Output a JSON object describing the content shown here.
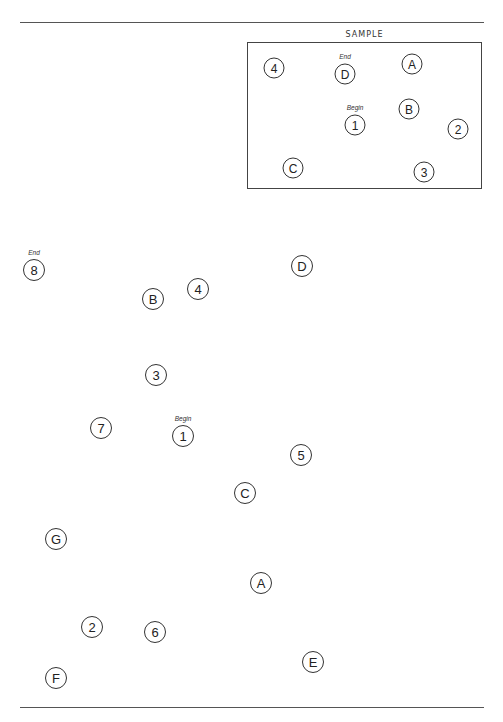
{
  "document": {
    "title": "Trail Making Test Part B",
    "sample": {
      "label": "SAMPLE",
      "box": {
        "left": 247,
        "top": 42,
        "right": 482,
        "bottom": 189
      },
      "nodes": [
        {
          "label": "4",
          "x": 274,
          "y": 68
        },
        {
          "label": "D",
          "x": 345,
          "y": 74,
          "tag": "End"
        },
        {
          "label": "A",
          "x": 412,
          "y": 64
        },
        {
          "label": "1",
          "x": 355,
          "y": 125,
          "tag": "Begin"
        },
        {
          "label": "B",
          "x": 409,
          "y": 109
        },
        {
          "label": "2",
          "x": 458,
          "y": 129
        },
        {
          "label": "C",
          "x": 293,
          "y": 168
        },
        {
          "label": "3",
          "x": 424,
          "y": 172
        }
      ]
    },
    "test": {
      "nodes": [
        {
          "label": "8",
          "x": 34,
          "y": 270,
          "tag": "End"
        },
        {
          "label": "B",
          "x": 153,
          "y": 299
        },
        {
          "label": "4",
          "x": 198,
          "y": 289
        },
        {
          "label": "D",
          "x": 302,
          "y": 266
        },
        {
          "label": "3",
          "x": 156,
          "y": 375
        },
        {
          "label": "7",
          "x": 101,
          "y": 428
        },
        {
          "label": "1",
          "x": 183,
          "y": 436,
          "tag": "Begin"
        },
        {
          "label": "5",
          "x": 301,
          "y": 455
        },
        {
          "label": "C",
          "x": 245,
          "y": 493
        },
        {
          "label": "G",
          "x": 56,
          "y": 539
        },
        {
          "label": "A",
          "x": 261,
          "y": 583
        },
        {
          "label": "2",
          "x": 92,
          "y": 627
        },
        {
          "label": "6",
          "x": 155,
          "y": 632
        },
        {
          "label": "E",
          "x": 313,
          "y": 662
        },
        {
          "label": "F",
          "x": 56,
          "y": 678
        }
      ]
    },
    "rules": {
      "top": {
        "y": 22,
        "x1": 20,
        "x2": 484
      },
      "bottom": {
        "y": 707,
        "x1": 20,
        "x2": 484
      }
    }
  }
}
